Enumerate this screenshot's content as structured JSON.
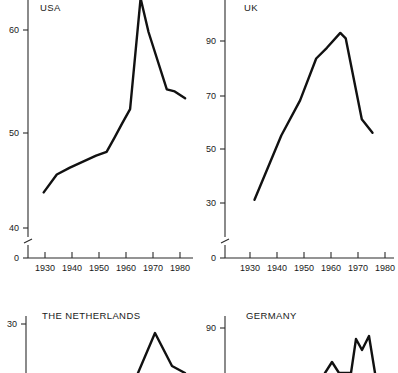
{
  "figure": {
    "background": "#ffffff",
    "line_color": "#111111",
    "axis_color": "#2b2b2b",
    "layout": "2x2 grid of small-multiple line charts; bottom row is cropped by the image edge"
  },
  "chart_data": [
    {
      "type": "line",
      "title": "USA",
      "panel": "top-left",
      "xlabel": "",
      "ylabel": "",
      "xlim": [
        1924,
        1987
      ],
      "ylim": [
        0,
        65
      ],
      "y_axis_break": true,
      "y_break_between": [
        0,
        40
      ],
      "grid": false,
      "legend": "none",
      "xticks": [
        1930,
        1940,
        1950,
        1960,
        1970,
        1980
      ],
      "xtick_labels": [
        "1930",
        "1940",
        "1950",
        "1960",
        "1970",
        "1980"
      ],
      "yticks": [
        0,
        40,
        50,
        60
      ],
      "ytick_labels": [
        "0",
        "40",
        "50",
        "60"
      ],
      "x": [
        1930,
        1935,
        1940,
        1945,
        1950,
        1954,
        1957,
        1960,
        1963,
        1967,
        1970,
        1977,
        1980,
        1984
      ],
      "values": [
        43.6,
        45.4,
        46.1,
        46.7,
        47.3,
        47.7,
        49.1,
        50.6,
        52.0,
        63.2,
        59.8,
        54.0,
        53.8,
        53.1
      ]
    },
    {
      "type": "line",
      "title": "UK",
      "panel": "top-right",
      "xlabel": "",
      "ylabel": "",
      "xlim": [
        1924,
        1987
      ],
      "ylim": [
        0,
        97
      ],
      "y_axis_break": true,
      "y_break_between": [
        0,
        30
      ],
      "grid": false,
      "legend": "none",
      "xticks": [
        1930,
        1940,
        1950,
        1960,
        1970,
        1980
      ],
      "xtick_labels": [
        "1930",
        "1940",
        "1950",
        "1960",
        "1970",
        "1980"
      ],
      "yticks": [
        0,
        30,
        50,
        70,
        90
      ],
      "ytick_labels": [
        "0",
        "30",
        "50",
        "70",
        "90"
      ],
      "x": [
        1935,
        1945,
        1952,
        1958,
        1962,
        1967,
        1969,
        1975,
        1979
      ],
      "values": [
        31.2,
        55.0,
        68.0,
        83.5,
        87.5,
        93.0,
        91.0,
        61.0,
        56.0
      ]
    },
    {
      "type": "line",
      "title": "THE NETHERLANDS",
      "panel": "bottom-left",
      "xlabel": "",
      "ylabel": "",
      "grid": false,
      "legend": "none",
      "yticks": [
        30
      ],
      "ytick_labels": [
        "30"
      ],
      "note": "panel cropped by image bottom edge; only the 30 tick, title and the start of a peak are visible",
      "x": [],
      "values": []
    },
    {
      "type": "line",
      "title": "GERMANY",
      "panel": "bottom-right",
      "xlabel": "",
      "ylabel": "",
      "grid": false,
      "legend": "none",
      "yticks": [
        90
      ],
      "ytick_labels": [
        "90"
      ],
      "note": "panel cropped by image bottom edge; only the 90 tick, title and the start of a jagged peak are visible",
      "x": [],
      "values": []
    }
  ],
  "panels": {
    "usa": {
      "title": "USA",
      "ytick_labels": [
        "60",
        "50",
        "40",
        "0"
      ],
      "xtick_labels": [
        "1930",
        "1940",
        "1950",
        "1960",
        "1970",
        "1980"
      ]
    },
    "uk": {
      "title": "UK",
      "ytick_labels": [
        "90",
        "70",
        "50",
        "30",
        "0"
      ],
      "xtick_labels": [
        "1930",
        "1940",
        "1950",
        "1960",
        "1970",
        "1980"
      ]
    },
    "netherlands": {
      "title": "THE NETHERLANDS",
      "ytick_labels": [
        "30"
      ]
    },
    "germany": {
      "title": "GERMANY",
      "ytick_labels": [
        "90"
      ]
    }
  }
}
